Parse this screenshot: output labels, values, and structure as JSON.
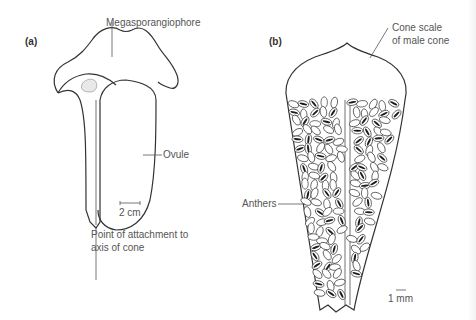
{
  "figure": {
    "panel_a": {
      "tag": "(a)",
      "labels": {
        "megasporangiophore": "Megasporangiophore",
        "ovule": "Ovule",
        "scale": "2 cm",
        "attachment_line1": "Point of attachment to",
        "attachment_line2": "axis of cone"
      }
    },
    "panel_b": {
      "tag": "(b)",
      "labels": {
        "cone_scale_line1": "Cone scale",
        "cone_scale_line2": "of male cone",
        "anthers": "Anthers",
        "scale": "1 mm"
      }
    },
    "colors": {
      "line": "#333333",
      "label": "#555555",
      "anther_fill": "#ffffff",
      "anther_slit": "#1a1a1a"
    }
  }
}
